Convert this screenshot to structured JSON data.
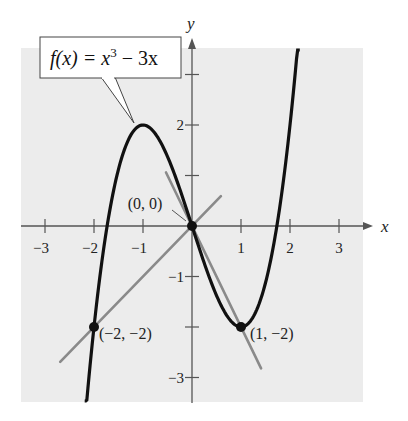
{
  "chart_data": {
    "type": "line",
    "title": "",
    "function_label": {
      "f": "f(x) = x",
      "exp": "3",
      "rest": " − 3x"
    },
    "xlabel": "x",
    "ylabel": "y",
    "xlim": [
      -3.5,
      3.7
    ],
    "ylim": [
      -3.5,
      3.7
    ],
    "grid": false,
    "x_ticks": [
      -3,
      -2,
      -1,
      1,
      2,
      3
    ],
    "x_tick_labels": [
      "−3",
      "−2",
      "−1",
      "1",
      "2",
      "3"
    ],
    "y_ticks": [
      -3,
      -2,
      -1,
      1,
      2,
      3
    ],
    "y_tick_labels": [
      "−3",
      "",
      "−1",
      "",
      "2",
      ""
    ],
    "series": [
      {
        "name": "f(x) = x^3 - 3x",
        "kind": "curve",
        "color": "#111111",
        "x_range": [
          -2.19,
          2.2
        ],
        "x": [
          -2.19,
          -2.0,
          -1.5,
          -1.0,
          -0.5,
          0.0,
          0.5,
          1.0,
          1.5,
          2.0,
          2.2
        ],
        "y": [
          -3.93,
          -2.0,
          1.125,
          2.0,
          1.375,
          0.0,
          -1.375,
          -2.0,
          -1.125,
          2.0,
          4.05
        ]
      },
      {
        "name": "secant y = x",
        "kind": "line",
        "color": "#8a8a8a",
        "x": [
          -2.69,
          0.59
        ],
        "y": [
          -2.69,
          0.59
        ]
      },
      {
        "name": "secant y = -2x",
        "kind": "line",
        "color": "#8a8a8a",
        "x": [
          -0.53,
          1.41
        ],
        "y": [
          1.06,
          -2.82
        ]
      }
    ],
    "points": [
      {
        "x": -2,
        "y": -2,
        "label": "(−2, −2)"
      },
      {
        "x": 0,
        "y": 0,
        "label": "(0, 0)"
      },
      {
        "x": 1,
        "y": -2,
        "label": "(1, −2)"
      }
    ],
    "colors": {
      "background_panel": "#ececec",
      "axis": "#555555",
      "curve": "#111111",
      "secant": "#8a8a8a"
    }
  }
}
